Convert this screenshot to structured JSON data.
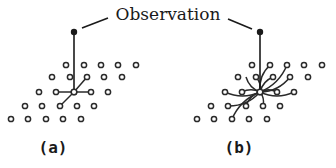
{
  "title": "Observation",
  "panels": [
    {
      "id": "a",
      "label": "(a)",
      "description": "Observation connected to one grid node which links to its 4 nearest neighbors",
      "observation_point": [
        74,
        32
      ],
      "center_node": [
        74,
        92
      ],
      "connection_style": "straight",
      "neighbors": [
        [
          56,
          92
        ],
        [
          91,
          92
        ],
        [
          87,
          77
        ],
        [
          60,
          106
        ]
      ]
    },
    {
      "id": "b",
      "label": "(b)",
      "description": "Observation connected to one grid node which links to many surrounding nodes via curved edges",
      "observation_point": [
        260,
        32
      ],
      "center_node": [
        260,
        92
      ],
      "connection_style": "curved",
      "neighbors": [
        [
          242,
          92
        ],
        [
          277,
          92
        ],
        [
          294,
          92
        ],
        [
          225,
          92
        ],
        [
          256,
          77
        ],
        [
          273,
          77
        ],
        [
          290,
          77
        ],
        [
          270,
          65
        ],
        [
          287,
          65
        ],
        [
          228,
          106
        ],
        [
          246,
          106
        ],
        [
          263,
          106
        ],
        [
          232,
          119
        ],
        [
          246,
          77
        ]
      ]
    }
  ],
  "grid": {
    "rows_y": [
      65,
      77,
      92,
      106,
      119
    ],
    "rows_x": [
      [
        66,
        84,
        101,
        118,
        136
      ],
      [
        52,
        70,
        87,
        104,
        122
      ],
      [
        39,
        56,
        74,
        91,
        108
      ],
      [
        25,
        42,
        60,
        77,
        94
      ],
      [
        11,
        28,
        46,
        63,
        81
      ]
    ],
    "panel_b_offset_x": 186
  }
}
